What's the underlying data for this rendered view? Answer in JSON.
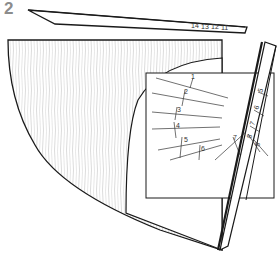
{
  "step": {
    "number": "2"
  },
  "top_strip": {
    "marks": [
      "14",
      "13",
      "12",
      "11"
    ]
  },
  "template": {
    "line_labels": [
      "1",
      "2",
      "3",
      "4",
      "5",
      "6",
      "7"
    ]
  },
  "side_strip": {
    "labels": [
      "5",
      "6",
      "7",
      "8",
      "8"
    ]
  },
  "colors": {
    "outline": "#1a1a1a",
    "wood_grain": "#bdbdbd",
    "step_number": "#8c8c8c",
    "background": "#ffffff"
  }
}
